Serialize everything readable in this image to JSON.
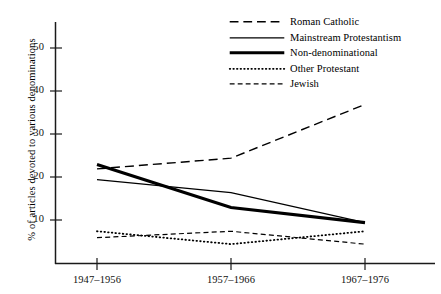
{
  "chart_data": {
    "type": "line",
    "title": "",
    "xlabel": "",
    "ylabel": "% of articles devoted to various denominations",
    "categories": [
      "1947–1956",
      "1957–1966",
      "1967–1976"
    ],
    "ylim": [
      0,
      55
    ],
    "yticks": [
      10,
      20,
      30,
      40,
      50
    ],
    "grid": false,
    "legend_position": "top-right",
    "series": [
      {
        "name": "Roman Catholic",
        "values": [
          22,
          24.5,
          37
        ],
        "style": "long-dashed",
        "width": 1.3
      },
      {
        "name": "Mainstream Protestantism",
        "values": [
          19.5,
          16.5,
          9.5
        ],
        "style": "solid-thin",
        "width": 1.2
      },
      {
        "name": "Non-denominational",
        "values": [
          23,
          13,
          9.5
        ],
        "style": "solid-thick",
        "width": 3.0
      },
      {
        "name": "Other Protestant",
        "values": [
          7.5,
          4.5,
          7.5
        ],
        "style": "dotted",
        "width": 1.6
      },
      {
        "name": "Jewish",
        "values": [
          6,
          7.5,
          4.5
        ],
        "style": "short-dashed",
        "width": 1.2
      }
    ]
  },
  "axes": {
    "y_tick_labels": [
      "50",
      "40",
      "30",
      "20",
      "10"
    ],
    "x_tick_labels": [
      "1947–1956",
      "1957–1966",
      "1967–1976"
    ],
    "y_axis_title": "% of articles devoted to various denominations"
  },
  "legend": {
    "items": [
      {
        "label": "Roman Catholic"
      },
      {
        "label": "Mainstream Protestantism"
      },
      {
        "label": "Non-denominational"
      },
      {
        "label": "Other Protestant"
      },
      {
        "label": "Jewish"
      }
    ]
  },
  "colors": {
    "ink": "#000000",
    "background": "#ffffff",
    "axis": "#1a1a1a"
  }
}
